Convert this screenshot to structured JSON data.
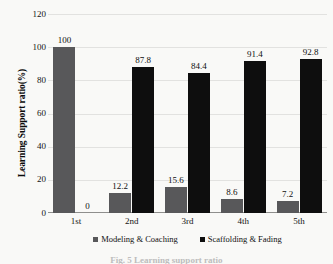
{
  "chart_data": {
    "type": "bar",
    "title": "",
    "subtitle": "",
    "xlabel": "",
    "ylabel": "Learning Support ratio(%)",
    "categories": [
      "1st",
      "2nd",
      "3rd",
      "4th",
      "5th"
    ],
    "series": [
      {
        "name": "Modeling & Coaching",
        "color": "#58585a",
        "values": [
          100,
          12.2,
          15.6,
          8.6,
          7.2
        ],
        "labels": [
          "100",
          "12.2",
          "15.6",
          "8.6",
          "7.2"
        ]
      },
      {
        "name": "Scaffolding & Fading",
        "color": "#0e0e0e",
        "values": [
          0,
          87.8,
          84.4,
          91.4,
          92.8
        ],
        "labels": [
          "0",
          "87.8",
          "84.4",
          "91.4",
          "92.8"
        ]
      }
    ],
    "ylim": [
      0,
      120
    ],
    "yticks": [
      0,
      20,
      40,
      60,
      80,
      100,
      120
    ],
    "ytick_labels": [
      "0",
      "20",
      "40",
      "60",
      "80",
      "100",
      "120"
    ],
    "grid": true,
    "grid_axis": "y",
    "legend_position": "bottom",
    "data_labels": true
  },
  "caption": {
    "text": "Fig. 5  Learning support ratio"
  },
  "colors": {
    "background": "#f9f9f7",
    "grid": "#e2e2e0",
    "axis": "#8f8f8d",
    "text": "#101010"
  }
}
